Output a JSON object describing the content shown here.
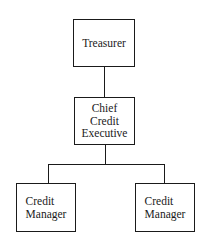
{
  "diagram": {
    "type": "org-chart",
    "nodes": [
      {
        "id": "treasurer",
        "label": "Treasurer"
      },
      {
        "id": "chief",
        "label": "Chief\nCredit\nExecutive"
      },
      {
        "id": "cm_left",
        "label": "Credit\nManager"
      },
      {
        "id": "cm_right",
        "label": "Credit\nManager"
      }
    ],
    "edges": [
      {
        "from": "treasurer",
        "to": "chief"
      },
      {
        "from": "chief",
        "to": "cm_left"
      },
      {
        "from": "chief",
        "to": "cm_right"
      }
    ]
  }
}
